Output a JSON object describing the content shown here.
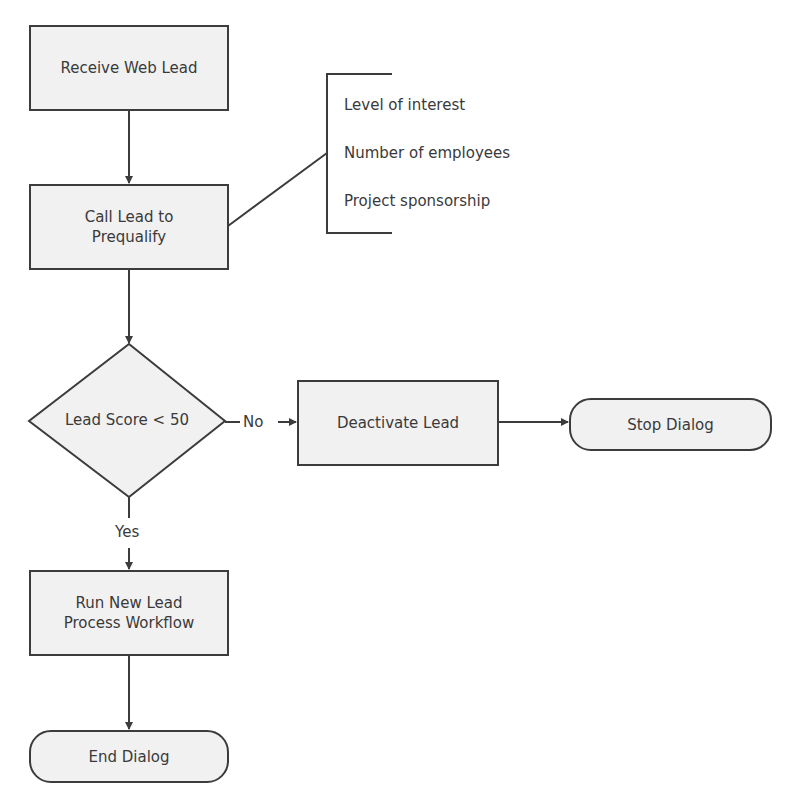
{
  "diagram": {
    "type": "flowchart",
    "colors": {
      "shape_fill": "#f1f1f1",
      "stroke": "#3c3c3c",
      "text": "#3a3a3a",
      "background": "#ffffff"
    },
    "nodes": [
      {
        "id": "receive",
        "shape": "rectangle",
        "label": "Receive Web Lead"
      },
      {
        "id": "call",
        "shape": "rectangle",
        "label": "Call Lead to Prequalify",
        "lines": [
          "Call Lead to",
          "Prequalify"
        ]
      },
      {
        "id": "decision",
        "shape": "diamond",
        "label": "Lead Score < 50"
      },
      {
        "id": "deactivate",
        "shape": "rectangle",
        "label": "Deactivate Lead"
      },
      {
        "id": "stop",
        "shape": "terminator",
        "label": "Stop Dialog"
      },
      {
        "id": "run",
        "shape": "rectangle",
        "label": "Run New Lead Process Workflow",
        "lines": [
          "Run New Lead",
          "Process Workflow"
        ]
      },
      {
        "id": "end",
        "shape": "terminator",
        "label": "End Dialog"
      }
    ],
    "annotation": {
      "attached_to": "call",
      "items": [
        "Level of interest",
        "Number of employees",
        "Project sponsorship"
      ]
    },
    "edges": [
      {
        "from": "receive",
        "to": "call",
        "label": ""
      },
      {
        "from": "call",
        "to": "decision",
        "label": ""
      },
      {
        "from": "decision",
        "to": "deactivate",
        "label": "No"
      },
      {
        "from": "deactivate",
        "to": "stop",
        "label": ""
      },
      {
        "from": "decision",
        "to": "run",
        "label": "Yes"
      },
      {
        "from": "run",
        "to": "end",
        "label": ""
      }
    ]
  }
}
